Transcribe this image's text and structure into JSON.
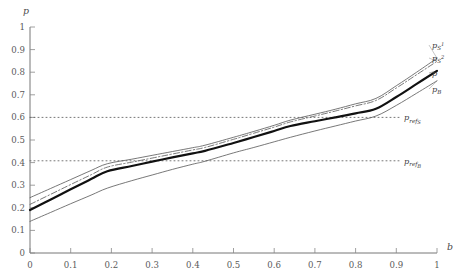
{
  "chart_data": {
    "type": "line",
    "title": "",
    "xlabel": "b",
    "ylabel": "p",
    "xlim": [
      0,
      1
    ],
    "ylim": [
      0,
      1
    ],
    "grid": false,
    "legend_position": "right-inline-labels",
    "xticks": [
      "0",
      "0.1",
      "0.2",
      "0.3",
      "0.4",
      "0.5",
      "0.6",
      "0.7",
      "0.8",
      "0.9",
      "1"
    ],
    "xtick_values": [
      0,
      0.1,
      0.2,
      0.3,
      0.4,
      0.5,
      0.6,
      0.7,
      0.8,
      0.9,
      1
    ],
    "yticks": [
      "0",
      "0.1",
      "0.2",
      "0.3",
      "0.4",
      "0.5",
      "0.6",
      "0.7",
      "0.8",
      "0.9",
      "1"
    ],
    "ytick_values": [
      0,
      0.1,
      0.2,
      0.3,
      0.4,
      0.5,
      0.6,
      0.7,
      0.8,
      0.9,
      1
    ],
    "x": [
      0,
      0.05,
      0.1,
      0.15,
      0.19,
      0.25,
      0.3,
      0.35,
      0.4,
      0.43,
      0.5,
      0.55,
      0.6,
      0.64,
      0.7,
      0.75,
      0.8,
      0.85,
      0.9,
      0.95,
      1
    ],
    "series": [
      {
        "name": "p_S1",
        "label_main": "p",
        "label_sub": "S",
        "label_sup": "1",
        "style": "thin-solid",
        "color": "#555555",
        "width": 0.8,
        "values": [
          0.245,
          0.285,
          0.325,
          0.365,
          0.395,
          0.415,
          0.432,
          0.449,
          0.466,
          0.477,
          0.512,
          0.538,
          0.565,
          0.588,
          0.614,
          0.636,
          0.66,
          0.684,
          0.74,
          0.8,
          0.862
        ]
      },
      {
        "name": "p_S2",
        "label_main": "p",
        "label_sub": "S",
        "label_sup": "2",
        "style": "dash-dot",
        "color": "#555555",
        "width": 0.8,
        "values": [
          0.215,
          0.259,
          0.303,
          0.346,
          0.38,
          0.402,
          0.42,
          0.438,
          0.456,
          0.467,
          0.503,
          0.53,
          0.557,
          0.58,
          0.606,
          0.628,
          0.651,
          0.675,
          0.73,
          0.789,
          0.848
        ]
      },
      {
        "name": "p",
        "label_main": "p",
        "label_sub": "",
        "label_sup": "",
        "style": "thick-solid",
        "color": "#111111",
        "width": 2.2,
        "values": [
          0.19,
          0.236,
          0.282,
          0.327,
          0.362,
          0.385,
          0.404,
          0.423,
          0.441,
          0.452,
          0.487,
          0.513,
          0.54,
          0.562,
          0.583,
          0.6,
          0.618,
          0.638,
          0.69,
          0.748,
          0.806
        ]
      },
      {
        "name": "p_B",
        "label_main": "p",
        "label_sub": "B",
        "label_sup": "",
        "style": "thin-solid",
        "color": "#555555",
        "width": 0.8,
        "values": [
          0.14,
          0.179,
          0.218,
          0.256,
          0.287,
          0.32,
          0.345,
          0.37,
          0.393,
          0.406,
          0.443,
          0.467,
          0.492,
          0.512,
          0.54,
          0.562,
          0.584,
          0.606,
          0.653,
          0.707,
          0.762
        ]
      }
    ],
    "reference_lines": [
      {
        "name": "p_ref_S",
        "label_main": "p",
        "label_sub": "ref",
        "label_sub2": "S",
        "value": 0.6,
        "style": "dotted",
        "color": "#666666"
      },
      {
        "name": "p_ref_B",
        "label_main": "p",
        "label_sub": "ref",
        "label_sub2": "B",
        "value": 0.408,
        "style": "dotted",
        "color": "#666666"
      }
    ]
  }
}
